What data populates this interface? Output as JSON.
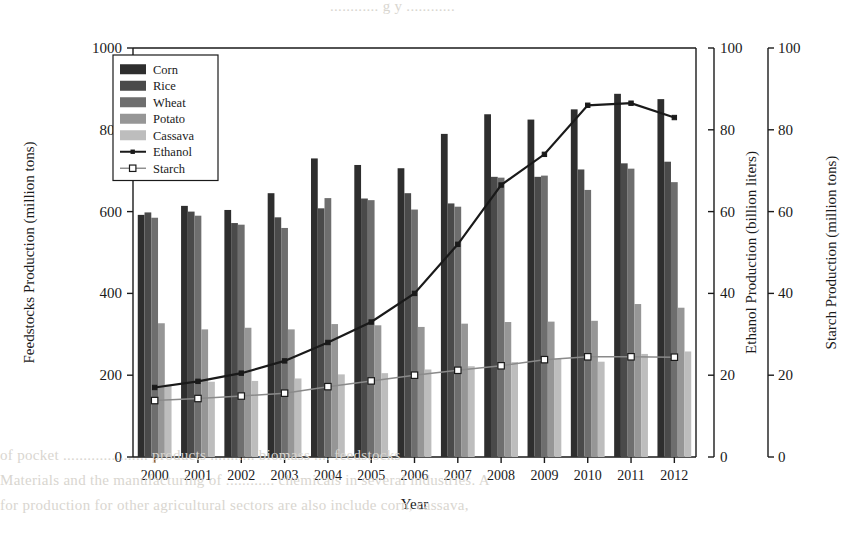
{
  "figure": {
    "background": "#ffffff",
    "ink": "#1a1a1a"
  },
  "bleed_through": {
    "top": "............ g  y ............",
    "line1": "of  pocket  .....................  products  ...........  biomass ....  feedstocks",
    "line2": "Materials  and  the  manufacturing  of  ............  chemicals  in  several  industries.  A",
    "line3": "for  production  for  other  agricultural  sectors  are  also  include  corn,  cassava,"
  },
  "axes": {
    "left": {
      "title": "Feedstocks Production (million tons)",
      "ticks": [
        0,
        200,
        400,
        600,
        800,
        1000
      ],
      "min": 0,
      "max": 1000
    },
    "right_inner": {
      "title": "Ethanol Production (billion liters)",
      "ticks": [
        0,
        20,
        40,
        60,
        80,
        100
      ],
      "min": 0,
      "max": 100
    },
    "right_outer": {
      "title": "Starch Production (million tons)",
      "ticks": [
        0,
        20,
        40,
        60,
        80,
        100
      ],
      "min": 0,
      "max": 100
    },
    "x": {
      "title": "Year"
    }
  },
  "legend": {
    "entries": [
      {
        "label": "Corn",
        "type": "bar",
        "color": "#2e2e2e"
      },
      {
        "label": "Rice",
        "type": "bar",
        "color": "#4a4a4a"
      },
      {
        "label": "Wheat",
        "type": "bar",
        "color": "#6e6e6e"
      },
      {
        "label": "Potato",
        "type": "bar",
        "color": "#969696"
      },
      {
        "label": "Cassava",
        "type": "bar",
        "color": "#bdbdbd"
      },
      {
        "label": "Ethanol",
        "type": "line",
        "color": "#1a1a1a",
        "marker": "triangle"
      },
      {
        "label": "Starch",
        "type": "line",
        "color": "#8a8a8a",
        "marker": "square"
      }
    ]
  },
  "chart_data": {
    "type": "bar",
    "title": "",
    "xlabel": "Year",
    "ylabel": "Feedstocks Production (million tons)",
    "categories": [
      "2000",
      "2001",
      "2002",
      "2003",
      "2004",
      "2005",
      "2006",
      "2007",
      "2008",
      "2009",
      "2010",
      "2011",
      "2012"
    ],
    "ylim": [
      0,
      1000
    ],
    "y2lim": [
      0,
      100
    ],
    "grid": false,
    "legend_position": "upper-left",
    "series": [
      {
        "name": "Corn",
        "axis": "left",
        "kind": "bar",
        "values": [
          592,
          614,
          604,
          645,
          730,
          714,
          706,
          790,
          838,
          825,
          850,
          888,
          875
        ]
      },
      {
        "name": "Rice",
        "axis": "left",
        "kind": "bar",
        "values": [
          598,
          600,
          572,
          586,
          608,
          632,
          645,
          620,
          685,
          685,
          703,
          718,
          722
        ]
      },
      {
        "name": "Wheat",
        "axis": "left",
        "kind": "bar",
        "values": [
          585,
          590,
          568,
          560,
          633,
          628,
          605,
          612,
          683,
          688,
          653,
          705,
          672
        ]
      },
      {
        "name": "Potato",
        "axis": "left",
        "kind": "bar",
        "values": [
          327,
          312,
          316,
          312,
          325,
          322,
          318,
          326,
          330,
          331,
          333,
          374,
          365
        ]
      },
      {
        "name": "Cassava",
        "axis": "left",
        "kind": "bar",
        "values": [
          177,
          184,
          186,
          192,
          202,
          205,
          214,
          222,
          232,
          240,
          233,
          252,
          258
        ]
      },
      {
        "name": "Ethanol",
        "axis": "right",
        "kind": "line",
        "values": [
          17.0,
          18.5,
          20.5,
          23.5,
          28.0,
          33.0,
          40.0,
          52.0,
          66.5,
          74.0,
          86.0,
          86.5,
          83.0
        ]
      },
      {
        "name": "Starch",
        "axis": "right",
        "kind": "line",
        "values": [
          13.8,
          14.3,
          14.9,
          15.6,
          17.2,
          18.6,
          20.0,
          21.2,
          22.3,
          23.8,
          24.5,
          24.5,
          24.4
        ]
      }
    ]
  }
}
